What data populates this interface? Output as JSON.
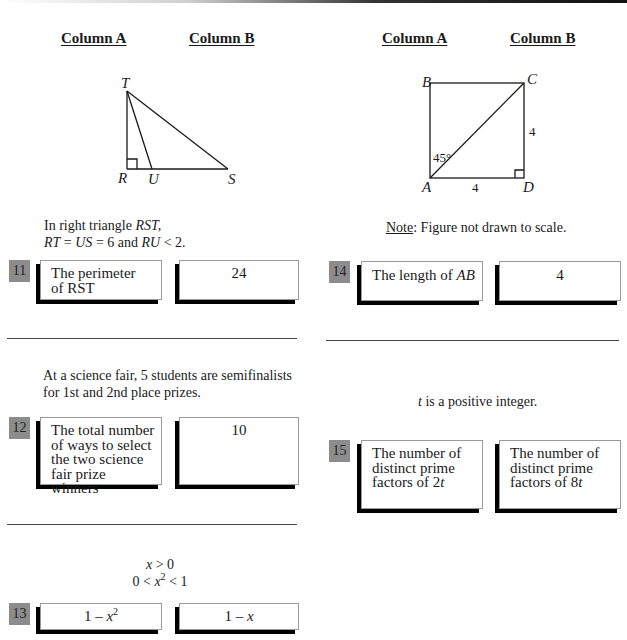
{
  "headers": {
    "left": {
      "column_a": "Column A",
      "column_b": "Column B"
    },
    "right": {
      "column_a": "Column A",
      "column_b": "Column B"
    }
  },
  "figure_triangle": {
    "vertices": {
      "T": "T",
      "R": "R",
      "U": "U",
      "S": "S"
    }
  },
  "figure_square": {
    "vertices": {
      "A": "A",
      "B": "B",
      "C": "C",
      "D": "D"
    },
    "angle_label": "45°",
    "side_cd": "4",
    "side_ad": "4"
  },
  "questions": [
    {
      "number": "11",
      "stem_line1_prefix": "In right triangle ",
      "stem_line1_var": "RST,",
      "stem_line2": [
        {
          "t": "RT",
          "i": true
        },
        {
          "t": " = ",
          "i": false
        },
        {
          "t": "US",
          "i": true
        },
        {
          "t": " = 6 and ",
          "i": false
        },
        {
          "t": "RU",
          "i": true
        },
        {
          "t": " < 2.",
          "i": false
        }
      ],
      "column_a_line1": "The perimeter",
      "column_a_line2": "of RST",
      "column_b": "24"
    },
    {
      "number": "12",
      "stem_line1": "At a science fair, 5 students are semifinalists",
      "stem_line2": "for 1st and 2nd place prizes.",
      "column_a_lines": [
        "The total number",
        "of ways to select",
        "the two science",
        "fair prize winners"
      ],
      "column_b": "10"
    },
    {
      "number": "13",
      "stem_line1_var": "x",
      "stem_line1_rest": " > 0",
      "stem_line2_prefix": "0 < ",
      "stem_line2_var": "x",
      "stem_line2_exp": "2",
      "stem_line2_suffix": " < 1",
      "column_a_prefix": "1 – ",
      "column_a_var": "x",
      "column_a_exp": "2",
      "column_b_prefix": "1 – ",
      "column_b_var": "x"
    },
    {
      "number": "14",
      "note_label": "Note",
      "note_text": ": Figure not drawn to scale.",
      "column_a_prefix": "The length of ",
      "column_a_var": "AB",
      "column_b": "4"
    },
    {
      "number": "15",
      "stem_var": "t",
      "stem_rest": " is a positive integer.",
      "column_a_lines": [
        "The number of",
        "distinct prime"
      ],
      "column_a_line3_prefix": "factors of 2",
      "column_a_line3_var": "t",
      "column_b_lines": [
        "The number of",
        "distinct prime"
      ],
      "column_b_line3_prefix": "factors of 8",
      "column_b_line3_var": "t"
    }
  ]
}
